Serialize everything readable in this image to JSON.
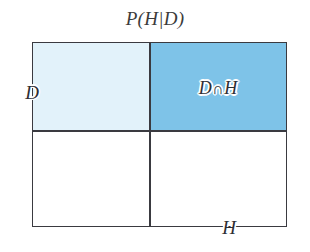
{
  "figure": {
    "title": "P(H|D)",
    "background_color": "#ffffff",
    "line_color": "#3a3a40"
  },
  "diagram": {
    "type": "partition-rectangle",
    "outer_label": "",
    "quadrants": [
      {
        "name": "d-only",
        "label": "",
        "fill": "#e2f2fa",
        "position": "top-left",
        "meaning": "D without H"
      },
      {
        "name": "d-and-h",
        "label": "D∩H",
        "fill": "#7ec3e8",
        "position": "top-right",
        "meaning": "D intersect H"
      },
      {
        "name": "neither",
        "label": "",
        "fill": "#ffffff",
        "position": "bottom-left",
        "meaning": "neither D nor H"
      },
      {
        "name": "h-only",
        "label": "",
        "fill": "#ffffff",
        "position": "bottom-right",
        "meaning": "H without D"
      }
    ]
  },
  "labels": {
    "d": "D",
    "d_and_h_left": "D",
    "d_and_h_symbol": "∩",
    "d_and_h_right": "H",
    "h": "H"
  }
}
